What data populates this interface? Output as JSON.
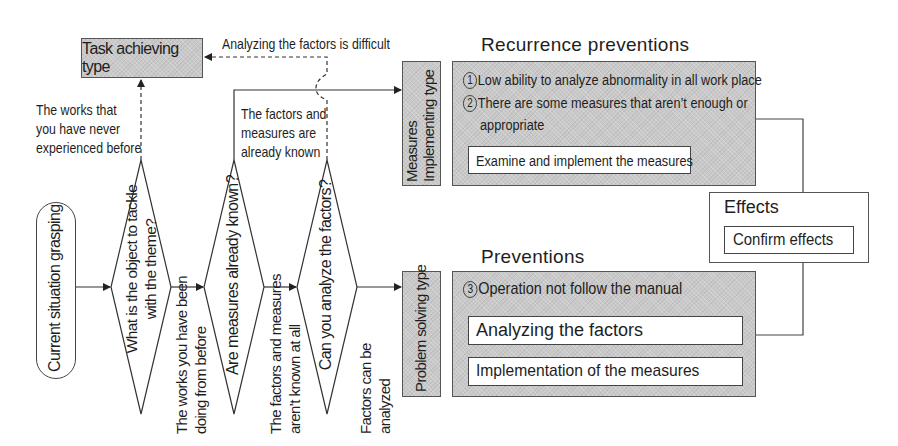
{
  "diagram": {
    "start_node": {
      "label": "Current situation grasping"
    },
    "decisions": [
      {
        "id": "d1",
        "question": "What is the object to tackle with the theme?"
      },
      {
        "id": "d2",
        "question": "Are measures already known?"
      },
      {
        "id": "d3",
        "question": "Can you analyze the factors?"
      }
    ],
    "branch_labels": {
      "never_experienced": "The works that you have never experienced before",
      "never_experienced_lines": [
        "The works that",
        "you have never",
        "experienced before"
      ],
      "doing_before_lines": [
        "The works you have been",
        "doing from before"
      ],
      "already_known_lines": [
        "The factors and",
        "measures are",
        "already known"
      ],
      "not_known_lines": [
        "The factors and measures",
        "aren’t known at all"
      ],
      "can_analyze_lines": [
        "Factors can be",
        "analyzed"
      ],
      "difficult": "Analyzing the factors is difficult"
    },
    "types": {
      "task_achieving": "Task achieving type",
      "measures_implementing_lines": [
        "Measures",
        "Implementing type"
      ],
      "problem_solving": "Problem solving type"
    },
    "recurrence": {
      "title": "Recurrence preventions",
      "items": [
        {
          "num": "1",
          "text": "Low ability to analyze abnormality in all work place"
        },
        {
          "num": "2",
          "text": "There are some measures that aren’t enough or",
          "cont": "appropriate"
        }
      ],
      "action": "Examine and implement the measures"
    },
    "preventions": {
      "title": "Preventions",
      "items": [
        {
          "num": "3",
          "text": "Operation not follow the manual"
        }
      ],
      "actions": [
        "Analyzing the factors",
        "Implementation of the measures"
      ]
    },
    "effects": {
      "title": "Effects",
      "action": "Confirm effects"
    },
    "colors": {
      "box_fill": "#c9c9c9",
      "line": "#333333",
      "background": "#ffffff"
    }
  }
}
